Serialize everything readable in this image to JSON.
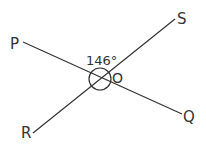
{
  "diagram": {
    "type": "intersecting-lines-angle",
    "intersection_point": "O",
    "angle_label": "146°",
    "angle_value_degrees": 146,
    "lines": [
      {
        "name": "line-PQ",
        "from": "P",
        "to": "Q"
      },
      {
        "name": "line-RS",
        "from": "R",
        "to": "S"
      }
    ],
    "points": {
      "P": "P",
      "Q": "Q",
      "R": "R",
      "S": "S",
      "O": "O"
    },
    "colors": {
      "line": "#333333",
      "text": "#333333",
      "background": "#ffffff"
    }
  }
}
